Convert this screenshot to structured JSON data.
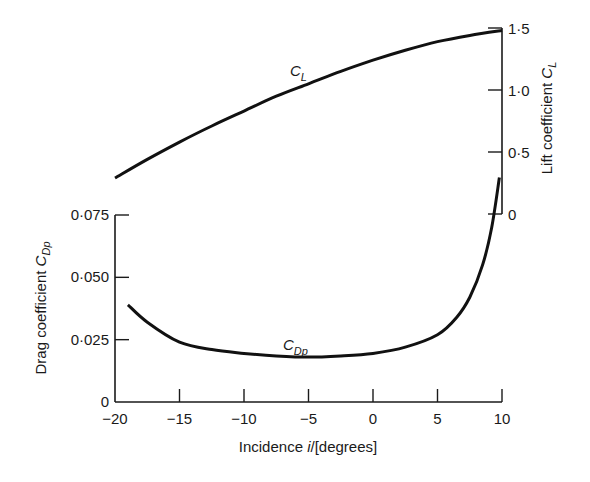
{
  "chart_data": {
    "type": "line",
    "title": "",
    "xlabel_prefix": "Incidence ",
    "xlabel_var": "i",
    "xlabel_suffix": "/[degrees]",
    "xlim": [
      -20,
      10
    ],
    "xticks": [
      -20,
      -15,
      -10,
      -5,
      0,
      5,
      10
    ],
    "xtick_labels": [
      "−20",
      "−15",
      "−10",
      "−5",
      "0",
      "5",
      "10"
    ],
    "left_axis": {
      "label_text": "Drag coefficient ",
      "label_var": "C",
      "label_sub": "Dp",
      "ylim": [
        0,
        0.075
      ],
      "ticks": [
        0,
        0.025,
        0.05,
        0.075
      ],
      "tick_labels": [
        "0",
        "0·025",
        "0·050",
        "0·075"
      ]
    },
    "right_axis": {
      "label_text": "Lift coefficient ",
      "label_var": "C",
      "label_sub": "L",
      "ylim": [
        0,
        1.5
      ],
      "ticks": [
        0,
        0.5,
        1.0,
        1.5
      ],
      "tick_labels": [
        "0",
        "0·5",
        "1·0",
        "1·5"
      ]
    },
    "grid": false,
    "series": [
      {
        "name": "C_L",
        "label_var": "C",
        "label_sub": "L",
        "axis": "right",
        "x": [
          -20,
          -17.5,
          -15,
          -12.5,
          -10,
          -7.5,
          -5,
          -2.5,
          0,
          2.5,
          5,
          7.5,
          10
        ],
        "y": [
          0.29,
          0.44,
          0.58,
          0.71,
          0.83,
          0.95,
          1.05,
          1.15,
          1.24,
          1.32,
          1.39,
          1.44,
          1.48
        ]
      },
      {
        "name": "C_Dp",
        "label_var": "C",
        "label_sub": "Dp",
        "axis": "left",
        "x": [
          -19,
          -17.5,
          -15,
          -12.5,
          -10,
          -7.5,
          -5,
          -2.5,
          0,
          2.5,
          5,
          6.5,
          7.5,
          8.5,
          9.2,
          9.8
        ],
        "y": [
          0.039,
          0.032,
          0.024,
          0.021,
          0.0195,
          0.0185,
          0.018,
          0.0185,
          0.0195,
          0.022,
          0.027,
          0.034,
          0.042,
          0.055,
          0.07,
          0.09
        ]
      }
    ]
  }
}
